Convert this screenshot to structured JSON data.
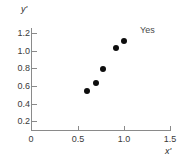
{
  "chart_data": {
    "type": "scatter",
    "title": "",
    "xlabel": "x'",
    "ylabel": "y'",
    "xlim": [
      0,
      1.5
    ],
    "ylim": [
      0,
      1.3
    ],
    "grid": false,
    "legend": "none",
    "x_ticks": [
      "0",
      "0.5",
      "1.0",
      "1.5"
    ],
    "x_tick_values": [
      0,
      0.5,
      1.0,
      1.5
    ],
    "y_ticks": [
      "0.2",
      "0.4",
      "0.6",
      "0.8",
      "1.0",
      "1.2"
    ],
    "y_tick_values": [
      0.2,
      0.4,
      0.6,
      0.8,
      1.0,
      1.2
    ],
    "series": [
      {
        "name": "points",
        "marker": "filled-circle",
        "color": "#0d0d0d",
        "x": [
          0.6,
          0.7,
          0.78,
          0.92,
          1.0
        ],
        "y": [
          0.54,
          0.63,
          0.79,
          1.03,
          1.11
        ]
      }
    ],
    "annotations": [
      {
        "text": "Yes",
        "x": 1.17,
        "y": 1.17
      }
    ],
    "axis_color": "#8a8a8a",
    "text_color": "#3a3a3a"
  },
  "axes": {
    "y_title": "y'",
    "x_title": "x'"
  },
  "annotation": {
    "label": "Yes"
  },
  "ticks": {
    "y": [
      {
        "label": "1.2"
      },
      {
        "label": "1.0"
      },
      {
        "label": "0.8"
      },
      {
        "label": "0.6"
      },
      {
        "label": "0.4"
      },
      {
        "label": "0.2"
      }
    ],
    "x": [
      {
        "label": "0"
      },
      {
        "label": "0.5"
      },
      {
        "label": "1.0"
      },
      {
        "label": "1.5"
      }
    ]
  }
}
